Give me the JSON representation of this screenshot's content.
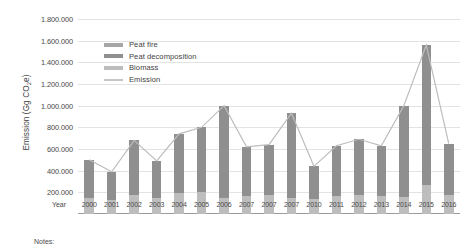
{
  "chart_data": {
    "type": "bar",
    "title": "",
    "xlabel": "Year",
    "ylabel": "Emission (Gg CO2e)",
    "ylabel_parts": {
      "main": "Emission (Gg CO",
      "sub": "2",
      "tail": "e)"
    },
    "categories": [
      "2000",
      "2001",
      "2002",
      "2003",
      "2004",
      "2005",
      "2006",
      "2007",
      "2007",
      "2007",
      "2010",
      "2011",
      "2012",
      "2013",
      "2014",
      "2015",
      "2016"
    ],
    "ylim": [
      0,
      1800000
    ],
    "ytick_values": [
      200000,
      400000,
      600000,
      800000,
      1000000,
      1200000,
      1400000,
      1600000,
      1800000
    ],
    "ytick_labels": [
      "200.000",
      "400.000",
      "600.000",
      "800.000",
      "1.000.000",
      "1.200.000",
      "1.400.000",
      "1.600.000",
      "1.800.000"
    ],
    "grid": true,
    "legend_position": "inside-top-left",
    "stacked": true,
    "series": [
      {
        "name": "Biomass",
        "color": "#bdbdbd",
        "values": [
          150000,
          130000,
          175000,
          150000,
          195000,
          205000,
          150000,
          165000,
          175000,
          150000,
          140000,
          165000,
          175000,
          165000,
          155000,
          270000,
          175000
        ]
      },
      {
        "name": "Peat decomposition",
        "color": "#8f8f8f",
        "values": [
          350000,
          260000,
          505000,
          340000,
          545000,
          595000,
          850000,
          455000,
          465000,
          780000,
          300000,
          465000,
          515000,
          465000,
          845000,
          1290000,
          475000
        ]
      }
    ],
    "line_series": {
      "name": "Emission",
      "color": "#bdbdbd",
      "values": [
        500000,
        390000,
        680000,
        490000,
        740000,
        800000,
        1000000,
        620000,
        640000,
        930000,
        440000,
        630000,
        690000,
        630000,
        1000000,
        1560000,
        650000
      ]
    },
    "totals": [
      500000,
      390000,
      680000,
      490000,
      740000,
      800000,
      1000000,
      620000,
      640000,
      930000,
      440000,
      630000,
      690000,
      630000,
      1000000,
      1560000,
      650000
    ],
    "legend": [
      {
        "label": "Peat fire",
        "color": "#a6a6a6",
        "kind": "swatch"
      },
      {
        "label": "Peat decomposition",
        "color": "#8f8f8f",
        "kind": "swatch"
      },
      {
        "label": "Biomass",
        "color": "#bdbdbd",
        "kind": "swatch"
      },
      {
        "label": "Emission",
        "color": "#c6c6c6",
        "kind": "line"
      }
    ]
  },
  "footer": {
    "notes_label": "Notes:"
  }
}
